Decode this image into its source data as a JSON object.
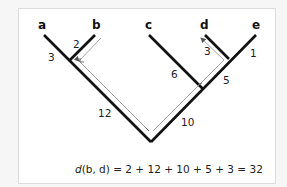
{
  "diagram": {
    "leaves": [
      {
        "id": "a",
        "label": "a"
      },
      {
        "id": "b",
        "label": "b"
      },
      {
        "id": "c",
        "label": "c"
      },
      {
        "id": "d",
        "label": "d"
      },
      {
        "id": "e",
        "label": "e"
      }
    ],
    "branch_lengths": [
      {
        "branch": "a",
        "value": "3"
      },
      {
        "branch": "b",
        "value": "2"
      },
      {
        "branch": "ab",
        "value": "12"
      },
      {
        "branch": "c",
        "value": "6"
      },
      {
        "branch": "d",
        "value": "3"
      },
      {
        "branch": "e",
        "value": "1"
      },
      {
        "branch": "de",
        "value": "5"
      },
      {
        "branch": "cde",
        "value": "10"
      }
    ],
    "formula": {
      "fn": "d",
      "text": "(b, d) = 2 + 12 + 10 + 5 + 3 = 32"
    },
    "colors": {
      "tree": "#111111",
      "path": "#9a9a9a",
      "background": "#ffffff"
    }
  }
}
